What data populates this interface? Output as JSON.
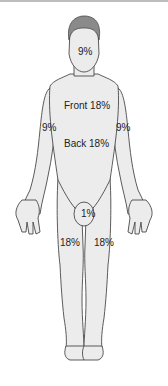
{
  "figure": {
    "labels": {
      "head": "9%",
      "front_torso": "Front 18%",
      "back_torso": "Back 18%",
      "left_arm": "9%",
      "right_arm": "9%",
      "genitals": "1%",
      "left_leg": "18%",
      "right_leg": "18%"
    }
  },
  "colors": {
    "skin": "#ececec",
    "hair": "#8a8a8a",
    "outline": "#4a4a4a",
    "text": "#222222",
    "border": "#bdbdbd"
  }
}
